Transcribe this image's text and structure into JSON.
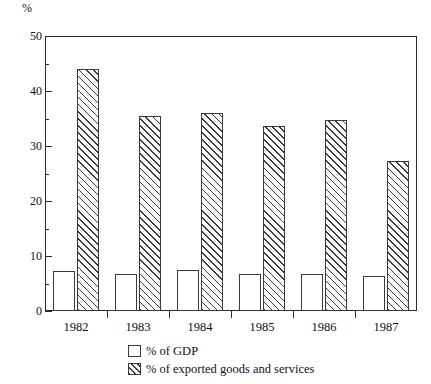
{
  "chart_data": {
    "type": "bar",
    "title": "",
    "xlabel": "",
    "ylabel": "%",
    "categories": [
      "1982",
      "1983",
      "1984",
      "1985",
      "1986",
      "1987"
    ],
    "series": [
      {
        "name": "% of GDP",
        "pattern": "empty",
        "values": [
          7.2,
          6.8,
          7.4,
          6.8,
          6.8,
          6.3
        ]
      },
      {
        "name": "% of exported goods and services",
        "pattern": "diagonal-hatch",
        "values": [
          44.0,
          35.4,
          36.0,
          33.6,
          34.8,
          27.2
        ]
      }
    ],
    "ylim": [
      0,
      50
    ],
    "ytick_major": [
      0,
      10,
      20,
      30,
      40,
      50
    ],
    "ytick_minor": [
      5,
      15,
      25,
      35,
      45
    ],
    "ytick_labels": [
      "0",
      "10",
      "20",
      "30",
      "40",
      "50"
    ],
    "grid": false,
    "legend_position": "bottom-center",
    "legend": [
      "% of GDP",
      "% of exported goods and services"
    ],
    "colors": {
      "axis": "#2b2b2b",
      "bar_outline": "#3a3a3a",
      "bar_fill": "#ffffff",
      "hatch": "#3a3a3a",
      "background": "#ffffff"
    }
  }
}
